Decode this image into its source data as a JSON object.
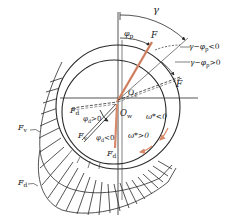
{
  "diagram": {
    "type": "journal-bearing-force-diagram",
    "colors": {
      "line": "#2a2a2a",
      "force_accent": "#d98a6a",
      "background": "#ffffff"
    },
    "labels": {
      "gamma": "γ",
      "phi_p": "φ",
      "phi_p_sub": "p",
      "F": "F",
      "F_tilde": "F̃",
      "O_c": "O",
      "O_c_sub": "c",
      "O_w": "O",
      "O_w_sub": "w",
      "gamma_minus_phi_neg": "γ−φ",
      "gamma_minus_phi_neg_sub": "p",
      "gamma_minus_phi_neg_cond": "<0",
      "gamma_minus_phi_pos": "γ−φ",
      "gamma_minus_phi_pos_sub": "p",
      "gamma_minus_phi_pos_cond": ">0",
      "F_d_left": "F",
      "F_d_left_sub": "d",
      "phi_d_pos": "φ",
      "phi_d_pos_sub": "d",
      "phi_d_pos_cond": ">0",
      "F_v_inner": "F",
      "F_v_inner_sub": "v",
      "phi_d_neg": "φ",
      "phi_d_neg_sub": "d",
      "phi_d_neg_cond": "<0",
      "F_d_bottom": "F",
      "F_d_bottom_sub": "d",
      "omega_neg": "ω*<0",
      "omega_pos": "ω*>0",
      "F_v_outer": "F",
      "F_v_outer_sub": "v",
      "F_d_outer": "F",
      "F_d_outer_sub": "d"
    }
  }
}
